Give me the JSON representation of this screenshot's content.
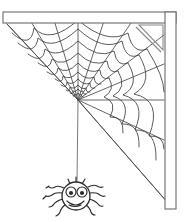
{
  "artwork": {
    "title": "Spider Web in Corner with Hanging Spider",
    "style": "black and white line art clipart",
    "background_color": "#ffffff",
    "line_color": "#3f3f3f",
    "frame_color": "#6b6b6b",
    "spider_color": "#2b2b2b",
    "canvas": {
      "width": 191,
      "height": 222
    }
  },
  "frame": {
    "name": "corner-frame",
    "horizontal_beam_label": "horizontal ceiling beam",
    "vertical_beam_label": "vertical wall beam",
    "bracket_label": "triangular corner gusset bracket",
    "horizontal_beam": {
      "x": 3,
      "y": 12,
      "width": 173,
      "height": 11
    },
    "vertical_beam": {
      "x": 165,
      "y": 12,
      "width": 11,
      "height": 197
    },
    "bracket": {
      "apex_x": 176,
      "apex_y": 23,
      "leg": 30
    }
  },
  "web": {
    "name": "spider-web",
    "hub_x": 78,
    "hub_y": 100,
    "radial_count": 11,
    "ring_count": 13,
    "start_angle_deg": 225,
    "end_angle_deg": 360,
    "inner_radius": 3,
    "outer_radius": 128,
    "anchors_label": "web anchored to beams and diagonal edges"
  },
  "spider": {
    "name": "hanging-spider",
    "expression": "smiling",
    "body_center_x": 76,
    "body_center_y": 196,
    "body_radius": 14,
    "leg_count": 8,
    "thread_top_x": 78,
    "thread_top_y": 101,
    "thread_bottom_y": 182,
    "eye_left_x": 71,
    "eye_right_x": 82,
    "eye_y": 192
  }
}
